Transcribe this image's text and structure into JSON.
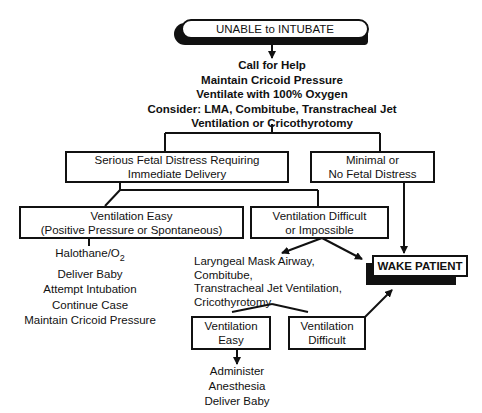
{
  "diagram": {
    "type": "flowchart",
    "title": "UNABLE to INTUBATE",
    "initial_actions": [
      "Call for Help",
      "Maintain Cricoid Pressure",
      "Ventilate with 100% Oxygen",
      "Consider: LMA, Combitube, Transtracheal Jet",
      "Ventilation or Cricothyrotomy"
    ],
    "branch_serious": {
      "line1": "Serious Fetal Distress Requiring",
      "line2": "Immediate Delivery"
    },
    "branch_minimal": {
      "line1": "Minimal or",
      "line2": "No Fetal Distress"
    },
    "vent_easy": {
      "line1": "Ventilation Easy",
      "line2": "(Positive Pressure or Spontaneous)"
    },
    "vent_difficult": {
      "line1": "Ventilation Difficult",
      "line2": "or Impossible"
    },
    "easy_actions": {
      "halothane": "Halothane/O",
      "halothane_sub": "2",
      "items": [
        "Deliver Baby",
        "Attempt Intubation",
        "Continue Case",
        "Maintain Cricoid Pressure"
      ]
    },
    "rescue_options": [
      "Laryngeal Mask Airway,",
      "Combitube,",
      "Transtracheal Jet Ventilation,",
      "Cricothyrotomy"
    ],
    "wake_patient": "WAKE PATIENT",
    "sub_vent_easy": {
      "line1": "Ventilation",
      "line2": "Easy"
    },
    "sub_vent_difficult": {
      "line1": "Ventilation",
      "line2": "Difficult"
    },
    "final_actions": [
      "Administer",
      "Anesthesia",
      "Deliver Baby"
    ]
  }
}
